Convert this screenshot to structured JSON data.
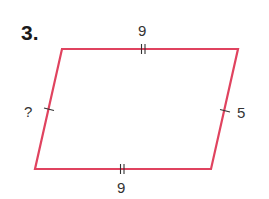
{
  "problem": {
    "number": "3."
  },
  "shape": {
    "type": "parallelogram",
    "stroke_color": "#E0435F",
    "tick_color": "#333333",
    "vertices": {
      "top_left": [
        62,
        49
      ],
      "top_right": [
        238,
        49
      ],
      "bottom_right": [
        211,
        169
      ],
      "bottom_left": [
        35,
        169
      ]
    }
  },
  "sides": {
    "top": {
      "label": "9",
      "tick_marks": 2
    },
    "bottom": {
      "label": "9",
      "tick_marks": 2
    },
    "left": {
      "label": "?",
      "tick_marks": 1
    },
    "right": {
      "label": "5",
      "tick_marks": 1
    }
  }
}
